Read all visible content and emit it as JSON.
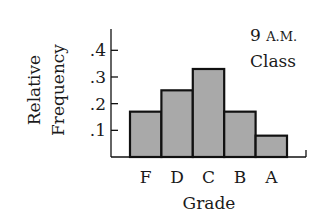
{
  "chart_data": {
    "type": "bar",
    "title": "",
    "annotation": [
      "9 A.M.",
      "Class"
    ],
    "xlabel": "Grade",
    "ylabel": [
      "Relative",
      "Frequency"
    ],
    "categories": [
      "F",
      "D",
      "C",
      "B",
      "A"
    ],
    "values": [
      0.17,
      0.25,
      0.33,
      0.17,
      0.08
    ],
    "ylim": [
      0,
      0.47
    ],
    "yticks": [
      0.1,
      0.2,
      0.3,
      0.4
    ],
    "ytick_labels": [
      ".1",
      ".2",
      ".3",
      ".4"
    ],
    "grid": false,
    "legend": null,
    "bar_fill": "#a9a9a9",
    "bar_edge": "#111111",
    "histogram_style": true
  }
}
